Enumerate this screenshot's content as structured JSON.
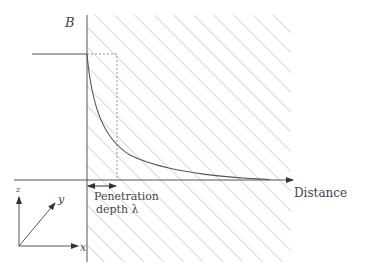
{
  "figure": {
    "labels": {
      "field_axis": "B",
      "distance_axis": "Distance",
      "penetration_line1": "Penetration",
      "penetration_line2": "depth λ"
    },
    "coordinate_axes": {
      "x_label": "x",
      "y_label": "y",
      "z_label": "z"
    },
    "colors": {
      "line": "#555555",
      "hatch": "#b8b8b8",
      "text": "#444444",
      "background": "#ffffff"
    }
  },
  "curve": {
    "type": "exponential decay",
    "description": "B drops from constant applied value outside to ~0 deep inside the superconductor",
    "penetration_depth_marker": "λ"
  }
}
